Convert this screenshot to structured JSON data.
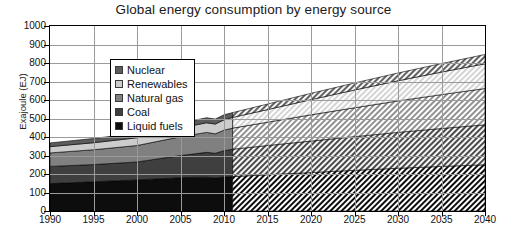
{
  "chart_data": {
    "type": "area",
    "stacked": true,
    "title": "Global energy consumption by energy source",
    "xlabel": "",
    "ylabel": "Exajoule (EJ)",
    "xlim": [
      1990,
      2040
    ],
    "ylim": [
      0,
      1000
    ],
    "grid": true,
    "legend_position": "top-left",
    "x_ticks": [
      "1990",
      "1995",
      "2000",
      "2005",
      "2010",
      "2015",
      "2020",
      "2025",
      "2030",
      "2035",
      "2040"
    ],
    "y_ticks": [
      "0",
      "100",
      "200",
      "300",
      "400",
      "500",
      "600",
      "700",
      "800",
      "900",
      "1000"
    ],
    "x": [
      1990,
      1995,
      2000,
      2005,
      2008,
      2009,
      2010,
      2011,
      2015,
      2020,
      2025,
      2030,
      2035,
      2040
    ],
    "history_end_year": 2011,
    "annotations": [
      {
        "text": "solid fill = history (1990-2011)"
      },
      {
        "text": "hatched fill = projection (2011-2040)"
      }
    ],
    "series": [
      {
        "name": "Liquid fuels",
        "color": "#0d0d0d",
        "order": 1,
        "values": [
          148,
          158,
          168,
          180,
          183,
          178,
          184,
          186,
          196,
          208,
          220,
          231,
          241,
          250
        ]
      },
      {
        "name": "Coal",
        "color": "#3f3f3f",
        "order": 2,
        "values": [
          93,
          93,
          97,
          120,
          134,
          134,
          142,
          148,
          158,
          170,
          182,
          194,
          205,
          216
        ]
      },
      {
        "name": "Natural gas",
        "color": "#808080",
        "order": 3,
        "values": [
          73,
          80,
          89,
          101,
          108,
          105,
          111,
          114,
          126,
          142,
          156,
          170,
          183,
          196
        ]
      },
      {
        "name": "Renewables",
        "color": "#cccccc",
        "order": 4,
        "values": [
          34,
          38,
          42,
          48,
          52,
          53,
          56,
          58,
          68,
          82,
          96,
          109,
          122,
          134
        ]
      },
      {
        "name": "Nuclear",
        "color": "#5c5c5c",
        "order": 5,
        "values": [
          20,
          23,
          25,
          27,
          27,
          27,
          27,
          26,
          30,
          34,
          38,
          42,
          46,
          50
        ]
      }
    ],
    "totals": [
      368,
      392,
      421,
      476,
      504,
      497,
      520,
      532,
      578,
      636,
      692,
      746,
      797,
      846
    ]
  },
  "legend": {
    "items": [
      {
        "label": "Nuclear"
      },
      {
        "label": "Renewables"
      },
      {
        "label": "Natural gas"
      },
      {
        "label": "Coal"
      },
      {
        "label": "Liquid fuels"
      }
    ]
  }
}
